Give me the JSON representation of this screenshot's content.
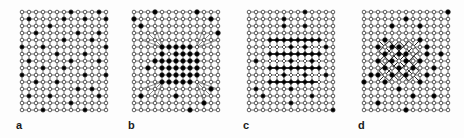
{
  "figure": {
    "width": 464,
    "height": 138,
    "background": "#fdfdfd",
    "node_open_fill": "#ffffff",
    "node_filled_fill": "#000000",
    "node_stroke": "#1a1a1a",
    "edge_color": "#444444",
    "label_color": "#1a1a1a",
    "caption_note": "Four square-lattice mesh panels with open and filled nodes"
  },
  "panels": [
    {
      "id": "panel-a",
      "label": "a",
      "label_x": 16,
      "label_y": 120,
      "x": 18,
      "y": 8,
      "width": 86,
      "height": 104,
      "cols": 13,
      "rows": 15,
      "spacing": 7,
      "pattern": "uniform-grid-sparse-filled",
      "description": "Uniform square lattice with randomly scattered filled nodes",
      "filled_nodes": [
        [
          0,
          7
        ],
        [
          0,
          11
        ],
        [
          1,
          1
        ],
        [
          1,
          6
        ],
        [
          1,
          9
        ],
        [
          1,
          12
        ],
        [
          2,
          4
        ],
        [
          3,
          2
        ],
        [
          3,
          8
        ],
        [
          3,
          11
        ],
        [
          4,
          6
        ],
        [
          4,
          10
        ],
        [
          5,
          0
        ],
        [
          5,
          3
        ],
        [
          5,
          12
        ],
        [
          6,
          5
        ],
        [
          6,
          9
        ],
        [
          7,
          1
        ],
        [
          7,
          7
        ],
        [
          7,
          11
        ],
        [
          8,
          3
        ],
        [
          8,
          6
        ],
        [
          9,
          0
        ],
        [
          9,
          9
        ],
        [
          9,
          12
        ],
        [
          10,
          2
        ],
        [
          10,
          5
        ],
        [
          11,
          8
        ],
        [
          11,
          10
        ],
        [
          12,
          1
        ],
        [
          12,
          4
        ],
        [
          12,
          11
        ],
        [
          13,
          7
        ],
        [
          14,
          3
        ],
        [
          14,
          9
        ]
      ]
    },
    {
      "id": "panel-b",
      "label": "b",
      "label_x": 128,
      "label_y": 120,
      "x": 130,
      "y": 8,
      "width": 92,
      "height": 104,
      "cols": 13,
      "rows": 15,
      "spacing": 7,
      "pattern": "central-dense-block",
      "description": "Lattice with a dense refined central block of filled nodes and radiating transition edges",
      "core": {
        "col_start": 4,
        "col_end": 9,
        "row_start": 5,
        "row_end": 10
      },
      "filled_nodes": [
        [
          0,
          3
        ],
        [
          0,
          9
        ],
        [
          1,
          11
        ],
        [
          1,
          0
        ],
        [
          2,
          1
        ],
        [
          3,
          12
        ],
        [
          5,
          4
        ],
        [
          5,
          5
        ],
        [
          5,
          6
        ],
        [
          5,
          7
        ],
        [
          5,
          8
        ],
        [
          6,
          4
        ],
        [
          6,
          6
        ],
        [
          6,
          7
        ],
        [
          6,
          8
        ],
        [
          6,
          9
        ],
        [
          7,
          3
        ],
        [
          7,
          4
        ],
        [
          7,
          5
        ],
        [
          7,
          6
        ],
        [
          7,
          7
        ],
        [
          7,
          8
        ],
        [
          7,
          9
        ],
        [
          8,
          2
        ],
        [
          8,
          4
        ],
        [
          8,
          5
        ],
        [
          8,
          6
        ],
        [
          8,
          7
        ],
        [
          8,
          8
        ],
        [
          8,
          9
        ],
        [
          9,
          4
        ],
        [
          9,
          5
        ],
        [
          9,
          6
        ],
        [
          9,
          7
        ],
        [
          9,
          8
        ],
        [
          9,
          9
        ],
        [
          10,
          4
        ],
        [
          10,
          5
        ],
        [
          10,
          6
        ],
        [
          10,
          7
        ],
        [
          10,
          8
        ],
        [
          11,
          11
        ],
        [
          12,
          1
        ],
        [
          12,
          6
        ],
        [
          13,
          10
        ],
        [
          14,
          8
        ]
      ]
    },
    {
      "id": "panel-c",
      "label": "c",
      "label_x": 243,
      "label_y": 120,
      "x": 245,
      "y": 8,
      "width": 92,
      "height": 104,
      "cols": 13,
      "rows": 15,
      "spacing": 7,
      "pattern": "horizontal-banded-rows",
      "description": "Lattice with refined central band of alternating fully-filled and mixed open/filled rows",
      "band": {
        "row_start": 4,
        "row_end": 10,
        "col_start": 3,
        "col_end": 10
      },
      "filled_nodes": [
        [
          0,
          8
        ],
        [
          1,
          5
        ],
        [
          2,
          5
        ],
        [
          2,
          8
        ],
        [
          4,
          3
        ],
        [
          4,
          4
        ],
        [
          4,
          5
        ],
        [
          4,
          6
        ],
        [
          4,
          7
        ],
        [
          4,
          8
        ],
        [
          4,
          9
        ],
        [
          4,
          10
        ],
        [
          5,
          6
        ],
        [
          5,
          8
        ],
        [
          5,
          11
        ],
        [
          6,
          3
        ],
        [
          6,
          4
        ],
        [
          6,
          5
        ],
        [
          6,
          6
        ],
        [
          6,
          7
        ],
        [
          6,
          8
        ],
        [
          6,
          9
        ],
        [
          6,
          10
        ],
        [
          7,
          1
        ],
        [
          7,
          6
        ],
        [
          7,
          9
        ],
        [
          8,
          3
        ],
        [
          8,
          4
        ],
        [
          8,
          5
        ],
        [
          8,
          6
        ],
        [
          8,
          7
        ],
        [
          8,
          8
        ],
        [
          8,
          9
        ],
        [
          8,
          10
        ],
        [
          9,
          5
        ],
        [
          9,
          8
        ],
        [
          9,
          11
        ],
        [
          10,
          3
        ],
        [
          10,
          4
        ],
        [
          10,
          5
        ],
        [
          10,
          6
        ],
        [
          10,
          7
        ],
        [
          10,
          8
        ],
        [
          10,
          9
        ],
        [
          11,
          1
        ],
        [
          11,
          6
        ],
        [
          12,
          2
        ],
        [
          12,
          9
        ],
        [
          13,
          6
        ],
        [
          14,
          12
        ]
      ]
    },
    {
      "id": "panel-d",
      "label": "d",
      "label_x": 358,
      "label_y": 120,
      "x": 360,
      "y": 8,
      "width": 94,
      "height": 104,
      "cols": 13,
      "rows": 15,
      "spacing": 7,
      "pattern": "rotated-diamond-lattice",
      "description": "Lattice with a 45-degree rotated diamond mesh region left of centre",
      "diamond": {
        "center_col": 5,
        "center_row": 7,
        "radius": 4
      },
      "filled_nodes": [
        [
          0,
          12
        ],
        [
          1,
          6
        ],
        [
          2,
          4
        ],
        [
          2,
          8
        ],
        [
          4,
          3
        ],
        [
          4,
          8
        ],
        [
          5,
          2
        ],
        [
          5,
          4
        ],
        [
          5,
          5
        ],
        [
          5,
          9
        ],
        [
          6,
          3
        ],
        [
          6,
          5
        ],
        [
          6,
          6
        ],
        [
          6,
          9
        ],
        [
          6,
          11
        ],
        [
          7,
          2
        ],
        [
          7,
          4
        ],
        [
          7,
          6
        ],
        [
          7,
          8
        ],
        [
          8,
          3
        ],
        [
          8,
          5
        ],
        [
          8,
          7
        ],
        [
          8,
          10
        ],
        [
          9,
          1
        ],
        [
          9,
          2
        ],
        [
          9,
          4
        ],
        [
          9,
          6
        ],
        [
          9,
          9
        ],
        [
          10,
          0
        ],
        [
          10,
          3
        ],
        [
          10,
          8
        ],
        [
          11,
          5
        ],
        [
          12,
          7
        ],
        [
          12,
          10
        ],
        [
          13,
          2
        ],
        [
          14,
          6
        ]
      ]
    }
  ]
}
